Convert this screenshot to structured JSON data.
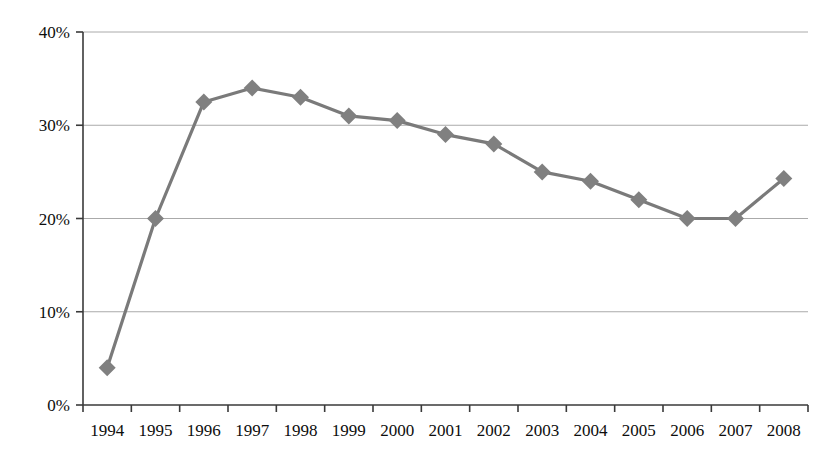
{
  "chart_data": {
    "type": "line",
    "title": "",
    "subtitle": "",
    "xlabel": "",
    "ylabel": "",
    "categories": [
      "1994",
      "1995",
      "1996",
      "1997",
      "1998",
      "1999",
      "2000",
      "2001",
      "2002",
      "2003",
      "2004",
      "2005",
      "2006",
      "2007",
      "2008"
    ],
    "values": [
      4.0,
      20.0,
      32.5,
      34.0,
      33.0,
      31.0,
      30.5,
      29.0,
      28.0,
      25.0,
      24.0,
      22.0,
      20.0,
      20.0,
      24.3
    ],
    "value_suffix": "%",
    "ylim": [
      0,
      40
    ],
    "ytick_values": [
      0,
      10,
      20,
      30,
      40
    ],
    "ytick_labels": [
      "0%",
      "10%",
      "20%",
      "30%",
      "40%"
    ],
    "grid": true,
    "grid_axis": "y",
    "legend": false,
    "legend_position": "none",
    "series": [
      {
        "name": "",
        "marker": "diamond",
        "values": [
          4.0,
          20.0,
          32.5,
          34.0,
          33.0,
          31.0,
          30.5,
          29.0,
          28.0,
          25.0,
          24.0,
          22.0,
          20.0,
          20.0,
          24.3
        ]
      }
    ],
    "annotations": []
  },
  "style": {
    "series_color": "#808080",
    "line_color": "#7a7a7a",
    "axis_color": "#3a3a3a",
    "grid_color": "#aaaaaa",
    "text_color": "#0d0d0d",
    "background": "#ffffff"
  },
  "axes": {
    "x_tick_labels": [
      "1994",
      "1995",
      "1996",
      "1997",
      "1998",
      "1999",
      "2000",
      "2001",
      "2002",
      "2003",
      "2004",
      "2005",
      "2006",
      "2007",
      "2008"
    ],
    "y_tick_labels": [
      "0%",
      "10%",
      "20%",
      "30%",
      "40%"
    ]
  }
}
